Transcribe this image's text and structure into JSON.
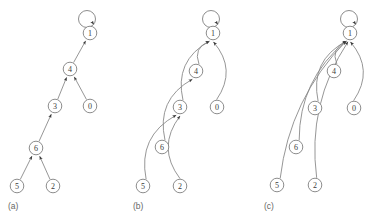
{
  "figure": {
    "title": "",
    "background_color": "#ffffff",
    "node_stroke_color": "#808080",
    "edge_stroke_color": "#8a8a8a",
    "label_color": "#3a3a3a",
    "panel_label_color": "#666666",
    "node_radius": 6.8,
    "panels": [
      {
        "id": "panel-a",
        "label": "(a)",
        "label_x": 8,
        "label_y": 206,
        "nodes": [
          {
            "id": "a-1",
            "value": "1",
            "cx": 90,
            "cy": 33
          },
          {
            "id": "a-4",
            "value": "4",
            "cx": 70,
            "cy": 69
          },
          {
            "id": "a-3",
            "value": "3",
            "cx": 55,
            "cy": 106
          },
          {
            "id": "a-0",
            "value": "0",
            "cx": 90,
            "cy": 106
          },
          {
            "id": "a-6",
            "value": "6",
            "cx": 36,
            "cy": 148
          },
          {
            "id": "a-5",
            "value": "5",
            "cx": 17,
            "cy": 186
          },
          {
            "id": "a-2",
            "value": "2",
            "cx": 53,
            "cy": 186
          }
        ],
        "self_loops": [
          {
            "node": "a-1",
            "cx": 87,
            "cy": 19,
            "r": 8.5
          }
        ],
        "edges": [
          {
            "from": "a-4",
            "to": "a-1",
            "style": "straight"
          },
          {
            "from": "a-3",
            "to": "a-4",
            "style": "straight"
          },
          {
            "from": "a-0",
            "to": "a-4",
            "style": "straight"
          },
          {
            "from": "a-6",
            "to": "a-3",
            "style": "straight"
          },
          {
            "from": "a-5",
            "to": "a-6",
            "style": "straight"
          },
          {
            "from": "a-2",
            "to": "a-6",
            "style": "straight"
          }
        ]
      },
      {
        "id": "panel-b",
        "label": "(b)",
        "label_x": 133,
        "label_y": 206,
        "nodes": [
          {
            "id": "b-1",
            "value": "1",
            "cx": 213,
            "cy": 33
          },
          {
            "id": "b-4",
            "value": "4",
            "cx": 196,
            "cy": 71
          },
          {
            "id": "b-3",
            "value": "3",
            "cx": 180,
            "cy": 107
          },
          {
            "id": "b-0",
            "value": "0",
            "cx": 217,
            "cy": 107
          },
          {
            "id": "b-6",
            "value": "6",
            "cx": 162,
            "cy": 147
          },
          {
            "id": "b-5",
            "value": "5",
            "cx": 143,
            "cy": 186
          },
          {
            "id": "b-2",
            "value": "2",
            "cx": 180,
            "cy": 186
          }
        ],
        "self_loops": [
          {
            "node": "b-1",
            "cx": 211,
            "cy": 19,
            "r": 8.5
          }
        ],
        "edges": [
          {
            "from": "b-4",
            "to": "b-1",
            "style": "curved"
          },
          {
            "from": "b-3",
            "to": "b-1",
            "style": "curved"
          },
          {
            "from": "b-0",
            "to": "b-1",
            "style": "curved"
          },
          {
            "from": "b-6",
            "to": "b-4",
            "style": "curved"
          },
          {
            "from": "b-5",
            "to": "b-3",
            "style": "curved"
          },
          {
            "from": "b-2",
            "to": "b-3",
            "style": "curved"
          }
        ]
      },
      {
        "id": "panel-c",
        "label": "(c)",
        "label_x": 264,
        "label_y": 206,
        "nodes": [
          {
            "id": "c-1",
            "value": "1",
            "cx": 350,
            "cy": 33
          },
          {
            "id": "c-4",
            "value": "4",
            "cx": 334,
            "cy": 71
          },
          {
            "id": "c-3",
            "value": "3",
            "cx": 315,
            "cy": 108
          },
          {
            "id": "c-0",
            "value": "0",
            "cx": 354,
            "cy": 108
          },
          {
            "id": "c-6",
            "value": "6",
            "cx": 296,
            "cy": 147
          },
          {
            "id": "c-5",
            "value": "5",
            "cx": 277,
            "cy": 185
          },
          {
            "id": "c-2",
            "value": "2",
            "cx": 315,
            "cy": 185
          }
        ],
        "self_loops": [
          {
            "node": "c-1",
            "cx": 349,
            "cy": 19,
            "r": 8.5
          }
        ],
        "edges": [
          {
            "from": "c-4",
            "to": "c-1",
            "style": "curved"
          },
          {
            "from": "c-3",
            "to": "c-1",
            "style": "curved"
          },
          {
            "from": "c-0",
            "to": "c-1",
            "style": "curved"
          },
          {
            "from": "c-6",
            "to": "c-1",
            "style": "curved"
          },
          {
            "from": "c-5",
            "to": "c-1",
            "style": "curved"
          },
          {
            "from": "c-2",
            "to": "c-1",
            "style": "curved"
          }
        ]
      }
    ]
  }
}
